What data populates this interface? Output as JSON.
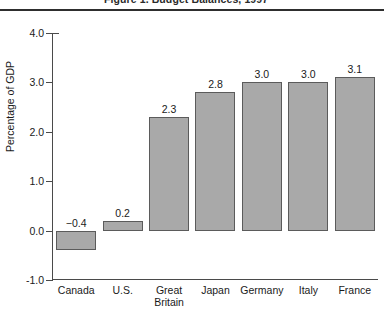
{
  "figure": {
    "title_partial": "Figure 1.  Budget Balances, 1997",
    "title_note": "title is cropped off at the top edge of the screenshot"
  },
  "chart_data": {
    "type": "bar",
    "title": "Figure 1.  Budget Balances, 1997",
    "xlabel": "",
    "ylabel": "Percentage of GDP",
    "ylim": [
      -1.0,
      4.0
    ],
    "ytick_labels": [
      "4.0",
      "3.0",
      "2.0",
      "1.0",
      "0.0",
      "-1.0"
    ],
    "ytick_values": [
      4.0,
      3.0,
      2.0,
      1.0,
      0.0,
      -1.0
    ],
    "grid": false,
    "legend": "none",
    "bar_color": "#a9a9a9",
    "bar_edge_color": "#5b5b5b",
    "categories": [
      "Canada",
      "U.S.",
      "Great\nBritain",
      "Japan",
      "Germany",
      "Italy",
      "France"
    ],
    "values": [
      -0.4,
      0.2,
      2.3,
      2.8,
      3.0,
      3.0,
      3.1
    ],
    "value_labels": [
      "−0.4",
      "0.2",
      "2.3",
      "2.8",
      "3.0",
      "3.0",
      "3.1"
    ]
  }
}
